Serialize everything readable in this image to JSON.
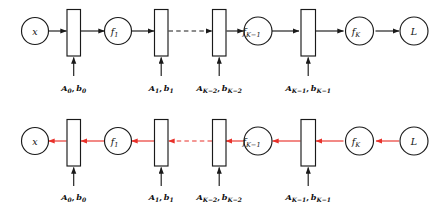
{
  "diagram": {
    "colors": {
      "forward_arrow": "#1a1a1a",
      "backward_arrow": "#e8312a",
      "stroke": "#1a1a1a",
      "node_fill": "#ffffff",
      "background": "#ffffff"
    },
    "forward_row": {
      "direction": "left-to-right",
      "arrow_color": "#1a1a1a",
      "nodes": [
        {
          "id": "x",
          "type": "circle",
          "label": "x",
          "sub": ""
        },
        {
          "id": "layer0",
          "type": "box",
          "label": ""
        },
        {
          "id": "f1",
          "type": "circle",
          "label": "f",
          "sub": "1"
        },
        {
          "id": "layer1",
          "type": "box",
          "label": ""
        },
        {
          "id": "layerK2",
          "type": "box",
          "label": ""
        },
        {
          "id": "fK1",
          "type": "circle",
          "label": "f",
          "sub": "K−1"
        },
        {
          "id": "layerK1",
          "type": "box",
          "label": ""
        },
        {
          "id": "fK",
          "type": "circle",
          "label": "f",
          "sub": "K"
        },
        {
          "id": "L",
          "type": "circle",
          "label": "L",
          "sub": ""
        }
      ],
      "dashed_segment_between": [
        "layer1",
        "layerK2"
      ]
    },
    "backward_row": {
      "direction": "right-to-left",
      "arrow_color": "#e8312a",
      "nodes": [
        {
          "id": "x",
          "type": "circle",
          "label": "x",
          "sub": ""
        },
        {
          "id": "layer0",
          "type": "box",
          "label": ""
        },
        {
          "id": "f1",
          "type": "circle",
          "label": "f",
          "sub": "1"
        },
        {
          "id": "layer1",
          "type": "box",
          "label": ""
        },
        {
          "id": "layerK2",
          "type": "box",
          "label": ""
        },
        {
          "id": "fK1",
          "type": "circle",
          "label": "f",
          "sub": "K−1"
        },
        {
          "id": "layerK1",
          "type": "box",
          "label": ""
        },
        {
          "id": "fK",
          "type": "circle",
          "label": "f",
          "sub": "K"
        },
        {
          "id": "L",
          "type": "circle",
          "label": "L",
          "sub": ""
        }
      ],
      "dashed_segment_between": [
        "layer1",
        "layerK2"
      ]
    },
    "parameter_labels": [
      {
        "id": "p0",
        "matrix": "A",
        "matrix_sub": "0",
        "vector": "b",
        "vector_sub": "0",
        "text": "A0, b0"
      },
      {
        "id": "p1",
        "matrix": "A",
        "matrix_sub": "1",
        "vector": "b",
        "vector_sub": "1",
        "text": "A1, b1"
      },
      {
        "id": "pK2",
        "matrix": "A",
        "matrix_sub": "K−2",
        "vector": "b",
        "vector_sub": "K−2",
        "text": "AK-2, bK-2"
      },
      {
        "id": "pK1",
        "matrix": "A",
        "matrix_sub": "K−1",
        "vector": "b",
        "vector_sub": "K−1",
        "text": "AK-1, bK-1"
      }
    ]
  }
}
